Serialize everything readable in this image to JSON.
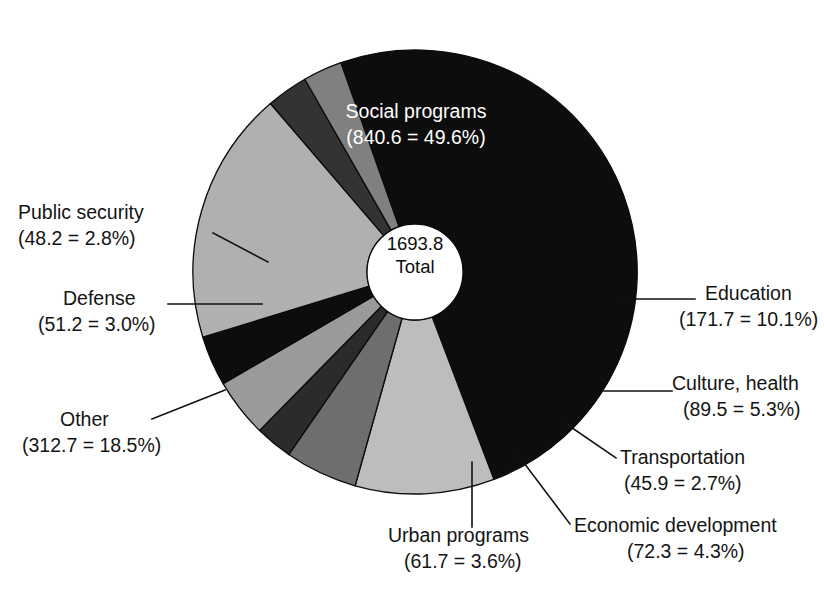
{
  "chart_data": {
    "type": "pie",
    "title": "",
    "title_clipped": true,
    "subtitle": "",
    "xlabel": "",
    "ylabel": "",
    "legend_position": "none",
    "grid": false,
    "donut": true,
    "total_value": "1693.8",
    "total_label": "Total",
    "center_text_line1": "1693.8",
    "center_text_line2": "Total",
    "categories": [
      "Social programs",
      "Education",
      "Culture, health",
      "Transportation",
      "Economic development",
      "Urban programs",
      "Other",
      "Defense",
      "Public security"
    ],
    "values": [
      840.6,
      171.7,
      89.5,
      45.9,
      72.3,
      61.7,
      312.7,
      51.2,
      48.2
    ],
    "percents": [
      49.6,
      10.1,
      5.3,
      2.7,
      4.3,
      3.6,
      18.5,
      3.0,
      2.8
    ],
    "colors": [
      "#0d0d0d",
      "#bdbdbd",
      "#6e6e6e",
      "#2b2b2b",
      "#9a9a9a",
      "#0d0d0d",
      "#b0b0b0",
      "#333333",
      "#808080"
    ]
  },
  "slices": [
    {
      "name": "Social programs",
      "value": "840.6",
      "percent": "49.6",
      "label_line1": "Social programs",
      "label_line2": "(840.6 = 49.6%)",
      "color": "#0d0d0d",
      "label_placement": "inside",
      "text_color": "#ffffff"
    },
    {
      "name": "Education",
      "value": "171.7",
      "percent": "10.1",
      "label_line1": "Education",
      "label_line2": "(171.7 = 10.1%)",
      "color": "#bdbdbd",
      "label_placement": "right",
      "text_color": "#141414"
    },
    {
      "name": "Culture, health",
      "value": "89.5",
      "percent": "5.3",
      "label_line1": "Culture, health",
      "label_line2": "(89.5 = 5.3%)",
      "color": "#6e6e6e",
      "label_placement": "right",
      "text_color": "#141414"
    },
    {
      "name": "Transportation",
      "value": "45.9",
      "percent": "2.7",
      "label_line1": "Transportation",
      "label_line2": "(45.9 = 2.7%)",
      "color": "#2b2b2b",
      "label_placement": "right",
      "text_color": "#141414"
    },
    {
      "name": "Economic development",
      "value": "72.3",
      "percent": "4.3",
      "label_line1": "Economic development",
      "label_line2": "(72.3 = 4.3%)",
      "color": "#9a9a9a",
      "label_placement": "bottom-right",
      "text_color": "#141414"
    },
    {
      "name": "Urban programs",
      "value": "61.7",
      "percent": "3.6",
      "label_line1": "Urban programs",
      "label_line2": "(61.7 = 3.6%)",
      "color": "#0d0d0d",
      "label_placement": "bottom",
      "text_color": "#141414"
    },
    {
      "name": "Other",
      "value": "312.7",
      "percent": "18.5",
      "label_line1": "Other",
      "label_line2": "(312.7 = 18.5%)",
      "color": "#b0b0b0",
      "label_placement": "left",
      "text_color": "#141414"
    },
    {
      "name": "Defense",
      "value": "51.2",
      "percent": "3.0",
      "label_line1": "Defense",
      "label_line2": "(51.2 = 3.0%)",
      "color": "#333333",
      "label_placement": "left",
      "text_color": "#141414"
    },
    {
      "name": "Public security",
      "value": "48.2",
      "percent": "2.8",
      "label_line1": "Public security",
      "label_line2": "(48.2 = 2.8%)",
      "color": "#808080",
      "label_placement": "left",
      "text_color": "#141414"
    }
  ]
}
